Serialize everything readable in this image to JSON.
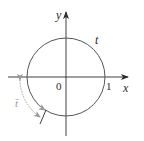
{
  "diagram": {
    "type": "unit-circle",
    "axes": {
      "x_label": "x",
      "y_label": "y"
    },
    "labels": {
      "origin": "0",
      "unit_point": "1",
      "arc_label_top": "t",
      "arc_label_negative": "t̄"
    },
    "colors": {
      "axis": "#2a2a2a",
      "circle": "#555555",
      "negative_arc": "#9a9a9a"
    }
  }
}
